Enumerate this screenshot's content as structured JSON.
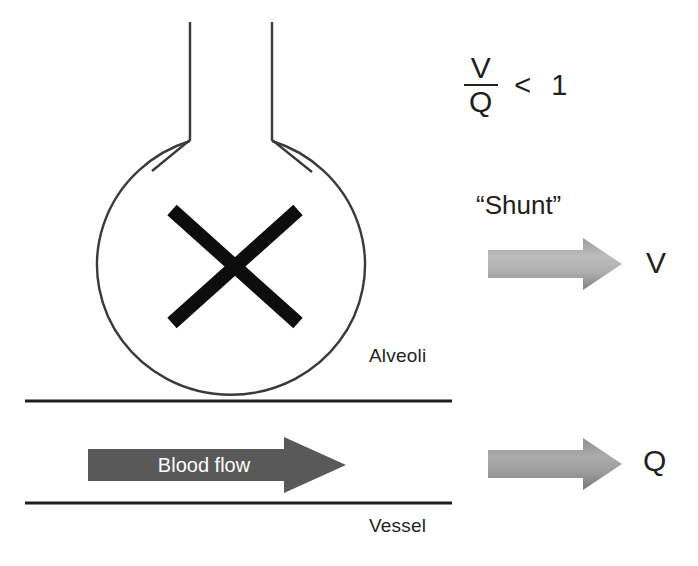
{
  "diagram": {
    "background_color": "#ffffff",
    "ink_color": "#231f20"
  },
  "alveolus": {
    "label": "Alveoli",
    "airway_tubes": 2,
    "blocked_marker": "x-cross",
    "outline_color": "#3a3a3a"
  },
  "vessel": {
    "label": "Vessel",
    "wall_color": "#231f20",
    "blood_flow": {
      "label": "Blood flow",
      "arrow_color": "#595959",
      "text_color": "#ffffff",
      "direction": "right"
    }
  },
  "ratio": {
    "numerator": "V",
    "denominator": "Q",
    "operator": "<",
    "value": "1"
  },
  "annotation": {
    "shunt_label": "“Shunt”"
  },
  "flows": [
    {
      "id": "ventilation",
      "label": "V",
      "arrow_color_light": "#b7b7b7",
      "arrow_color_dark": "#8d8d8d",
      "direction": "right"
    },
    {
      "id": "perfusion",
      "label": "Q",
      "arrow_color_light": "#a6a6a6",
      "arrow_color_dark": "#7d7d7d",
      "direction": "right"
    }
  ]
}
